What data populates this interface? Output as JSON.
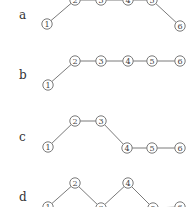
{
  "diagram": {
    "rows": [
      {
        "label": "a",
        "label_pos": [
          19,
          19
        ],
        "nodes": [
          {
            "id": "1",
            "x": 47,
            "y": 24
          },
          {
            "id": "2",
            "x": 75,
            "y": 0
          },
          {
            "id": "3",
            "x": 101,
            "y": 0
          },
          {
            "id": "4",
            "x": 128,
            "y": 0
          },
          {
            "id": "5",
            "x": 152,
            "y": 0
          },
          {
            "id": "6",
            "x": 180,
            "y": 26
          }
        ]
      },
      {
        "label": "b",
        "label_pos": [
          19,
          79
        ],
        "nodes": [
          {
            "id": "1",
            "x": 48,
            "y": 85
          },
          {
            "id": "2",
            "x": 75,
            "y": 61
          },
          {
            "id": "3",
            "x": 101,
            "y": 61
          },
          {
            "id": "4",
            "x": 128,
            "y": 61
          },
          {
            "id": "5",
            "x": 152,
            "y": 61
          },
          {
            "id": "6",
            "x": 180,
            "y": 61
          }
        ]
      },
      {
        "label": "c",
        "label_pos": [
          19,
          141
        ],
        "nodes": [
          {
            "id": "1",
            "x": 48,
            "y": 147
          },
          {
            "id": "2",
            "x": 75,
            "y": 121
          },
          {
            "id": "3",
            "x": 101,
            "y": 121
          },
          {
            "id": "4",
            "x": 127,
            "y": 148
          },
          {
            "id": "5",
            "x": 152,
            "y": 148
          },
          {
            "id": "6",
            "x": 180,
            "y": 148
          }
        ]
      },
      {
        "label": "d",
        "label_pos": [
          19,
          201
        ],
        "nodes": [
          {
            "id": "1",
            "x": 48,
            "y": 207
          },
          {
            "id": "2",
            "x": 75,
            "y": 183
          },
          {
            "id": "3",
            "x": 101,
            "y": 208
          },
          {
            "id": "4",
            "x": 128,
            "y": 183
          },
          {
            "id": "5",
            "x": 153,
            "y": 208
          },
          {
            "id": "6",
            "x": 180,
            "y": 207
          }
        ]
      }
    ],
    "node_radius": 5.2,
    "colors": {
      "stroke": "#6a6a6a",
      "text": "#444444",
      "edge": "#7a7a7a",
      "background": "#ffffff"
    }
  }
}
